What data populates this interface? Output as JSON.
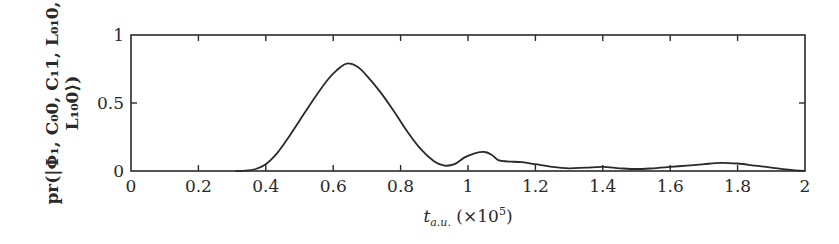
{
  "chart_data": {
    "type": "line",
    "title": "",
    "xlabel": "t_{a.u.} (×10^5)",
    "xlabel_parts": {
      "var": "t",
      "sub": "a.u.",
      "factor": " (×10",
      "exp": "5",
      "close": ")"
    },
    "ylabel": "pr(|Φ1, C00, C11, L010, L100⟩)",
    "ylabel_lines": [
      "pr(|Φ₁, C₀0, C₁1, L₀₁0,",
      "L₁₀0⟩)"
    ],
    "xlim": [
      0,
      2
    ],
    "ylim": [
      0,
      1
    ],
    "x_ticks": [
      "0",
      "0.2",
      "0.4",
      "0.6",
      "0.8",
      "1",
      "1.2",
      "1.4",
      "1.6",
      "1.8",
      "2"
    ],
    "x_tick_values": [
      0,
      0.2,
      0.4,
      0.6,
      0.8,
      1.0,
      1.2,
      1.4,
      1.6,
      1.8,
      2.0
    ],
    "y_ticks": [
      "0",
      "0.5",
      "1"
    ],
    "y_tick_values": [
      0,
      0.5,
      1
    ],
    "grid": false,
    "legend": null,
    "series": [
      {
        "name": "probability",
        "color": "#2a2a2a",
        "x": [
          0.31,
          0.34,
          0.37,
          0.4,
          0.43,
          0.46,
          0.5,
          0.54,
          0.58,
          0.61,
          0.64,
          0.67,
          0.7,
          0.74,
          0.78,
          0.82,
          0.86,
          0.9,
          0.93,
          0.96,
          0.99,
          1.02,
          1.05,
          1.07,
          1.09,
          1.12,
          1.16,
          1.2,
          1.25,
          1.3,
          1.35,
          1.4,
          1.45,
          1.5,
          1.55,
          1.6,
          1.65,
          1.7,
          1.75,
          1.8,
          1.85,
          1.9,
          1.95,
          2.0
        ],
        "y": [
          0.0,
          0.003,
          0.015,
          0.05,
          0.12,
          0.22,
          0.37,
          0.52,
          0.66,
          0.74,
          0.79,
          0.77,
          0.7,
          0.58,
          0.44,
          0.29,
          0.16,
          0.07,
          0.04,
          0.05,
          0.1,
          0.13,
          0.14,
          0.12,
          0.08,
          0.07,
          0.065,
          0.05,
          0.03,
          0.02,
          0.025,
          0.03,
          0.02,
          0.015,
          0.02,
          0.03,
          0.04,
          0.05,
          0.06,
          0.055,
          0.04,
          0.025,
          0.01,
          0.0
        ]
      }
    ]
  }
}
